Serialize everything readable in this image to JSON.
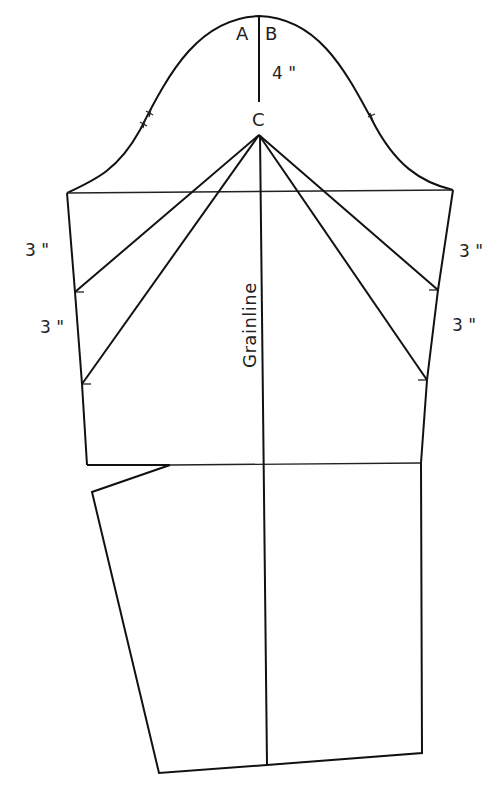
{
  "diagram": {
    "points": {
      "a": "A",
      "b": "B",
      "c": "C"
    },
    "measurements": {
      "cap_height": "4 \"",
      "left_upper": "3 \"",
      "left_lower": "3 \"",
      "right_upper": "3 \"",
      "right_lower": "3 \""
    },
    "grainline_label": "Grainline",
    "notches": {
      "back": "double-notch",
      "front": "single-notch"
    },
    "colors": {
      "line": "#111111",
      "background": "#ffffff"
    }
  }
}
